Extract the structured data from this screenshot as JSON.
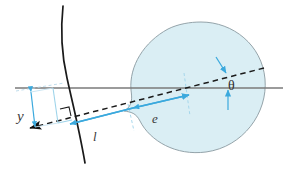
{
  "figure": {
    "type": "technical-line-diagram",
    "labels": {
      "y": "y",
      "l": "l",
      "e": "e",
      "theta": "θ"
    },
    "colors": {
      "blob_fill": "#daeef4",
      "blob_stroke": "#8a9aa0",
      "accent_blue": "#3ba9dd",
      "light_blue": "#9fd4ea",
      "axis_gray": "#7a7a7a",
      "curve_black": "#1a1a1a",
      "dash_black": "#1a1a1a",
      "label_gray": "#3a3a3a"
    },
    "elements": [
      {
        "name": "horizontal-axis",
        "desc": "gray horizontal reference line"
      },
      {
        "name": "boundary-curve",
        "desc": "black near-vertical curved surface"
      },
      {
        "name": "trajectory-dashed-line",
        "desc": "black dashed ray with left arrowhead"
      },
      {
        "name": "target-blob",
        "desc": "light blue rounded region with concave notch"
      },
      {
        "name": "y-dimension",
        "desc": "blue impact-parameter bracket labelled y"
      },
      {
        "name": "l-segment",
        "desc": "blue segment labelled l"
      },
      {
        "name": "e-segment",
        "desc": "blue double arrow labelled e"
      },
      {
        "name": "theta-angle",
        "desc": "angle between dashed ray and horizontal axis"
      },
      {
        "name": "right-angle-mark",
        "desc": "small square right angle marker at surface"
      }
    ]
  }
}
